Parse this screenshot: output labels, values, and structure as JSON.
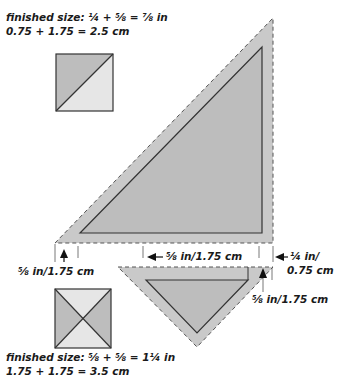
{
  "top_block": {
    "finished_size_line1": "finished size: ¼ + ⅝ = ⅞ in",
    "finished_size_line2": "0.75 + 1.75 = 2.5 cm"
  },
  "bottom_block": {
    "finished_size_line1": "finished size: ⅝ + ⅝ = 1¼ in",
    "finished_size_line2": "1.75 + 1.75 = 3.5 cm"
  },
  "dimensions": {
    "left_seam": "⅝ in/1.75 cm",
    "middle_seam": "⅝ in/1.75 cm",
    "right_seam_line1": "¼ in/",
    "right_seam_line2": "0.75 cm",
    "small_triangle_seam": "⅝ in/1.75 cm"
  },
  "colors": {
    "seam_allowance": "#c9c9c9",
    "fabric_dark": "#bdbdbd",
    "fabric_light": "#e6e6e6",
    "outline": "#333333",
    "text": "#1a1a1a"
  }
}
